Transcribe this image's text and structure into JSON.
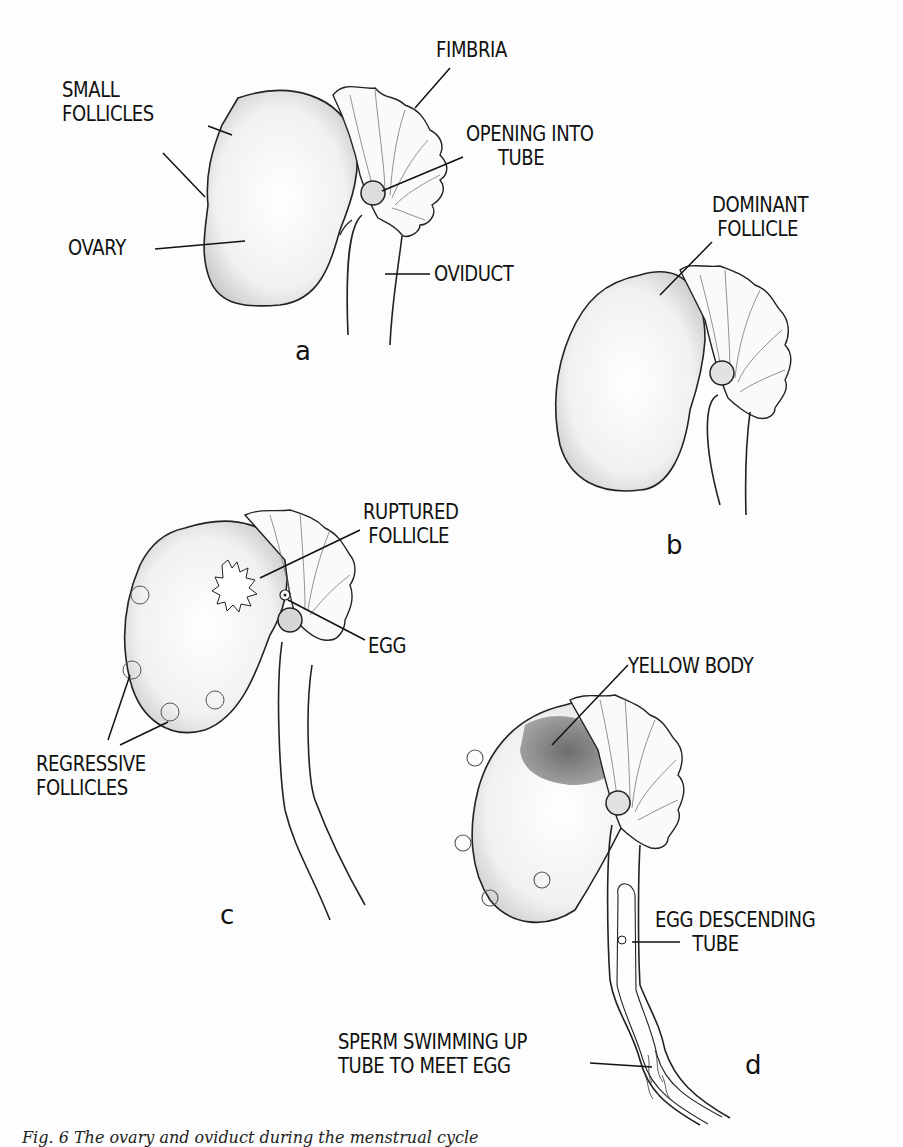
{
  "figure": {
    "panels": [
      {
        "id": "a",
        "letter": "a",
        "labels": {
          "fimbria": "FIMBRIA",
          "small_follicles": "SMALL\nFOLLICLES",
          "opening_into_tube": "OPENING INTO\n      TUBE",
          "ovary": "OVARY",
          "oviduct": "OVIDUCT"
        }
      },
      {
        "id": "b",
        "letter": "b",
        "labels": {
          "dominant_follicle": "DOMINANT\n FOLLICLE"
        }
      },
      {
        "id": "c",
        "letter": "c",
        "labels": {
          "ruptured_follicle": "RUPTURED\n FOLLICLE",
          "egg": "EGG",
          "regressive_follicles": "REGRESSIVE\nFOLLICLES"
        }
      },
      {
        "id": "d",
        "letter": "d",
        "labels": {
          "yellow_body": "YELLOW BODY",
          "egg_descending_tube": "EGG DESCENDING\n       TUBE",
          "sperm": "SPERM SWIMMING UP\nTUBE TO MEET EGG"
        }
      }
    ],
    "caption": "Fig. 6 The ovary and oviduct during the menstrual cycle"
  }
}
